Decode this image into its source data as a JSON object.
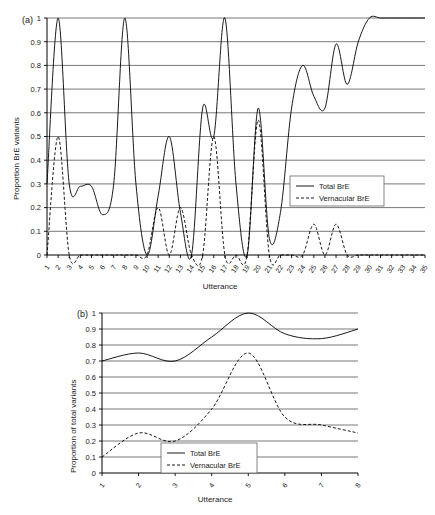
{
  "figure": {
    "header_faint_text": "",
    "panels": [
      {
        "tag": "(a)",
        "ylabel": "Proportion BrE variants",
        "xlabel": "Utterance",
        "legend": {
          "total": "Total BrE",
          "vernacular": "Vernacular BrE"
        }
      },
      {
        "tag": "(b)",
        "ylabel": "Proportion of total variants",
        "xlabel": "Utterance",
        "legend": {
          "total": "Total BrE",
          "vernacular": "Vernacular BrE"
        }
      }
    ]
  },
  "chart_data": [
    {
      "type": "line",
      "panel": "(a)",
      "title": "",
      "xlabel": "Utterance",
      "ylabel": "Proportion BrE variants",
      "xlim": [
        1,
        35
      ],
      "ylim": [
        0,
        1
      ],
      "yticks": [
        0,
        0.1,
        0.2,
        0.3,
        0.4,
        0.5,
        0.6,
        0.7,
        0.8,
        0.9,
        1
      ],
      "ytick_labels": [
        "0",
        "0.1",
        "0.2",
        "0.3",
        "0.4",
        "0.5",
        "0.6",
        "0.7",
        "0.8",
        "0.9",
        "1"
      ],
      "grid": true,
      "legend_position": "center-right",
      "categories": [
        1,
        2,
        3,
        4,
        5,
        6,
        7,
        8,
        9,
        10,
        11,
        12,
        13,
        14,
        15,
        16,
        17,
        18,
        19,
        20,
        21,
        22,
        23,
        24,
        25,
        26,
        27,
        28,
        29,
        30,
        31,
        32,
        33,
        34,
        35
      ],
      "series": [
        {
          "name": "Total BrE",
          "style": "solid",
          "values": [
            0.3,
            1.0,
            0.3,
            0.29,
            0.29,
            0.17,
            0.3,
            1.0,
            0.3,
            0.0,
            0.25,
            0.5,
            0.18,
            0.0,
            0.62,
            0.5,
            1.0,
            0.3,
            0.0,
            0.62,
            0.07,
            0.18,
            0.62,
            0.8,
            0.67,
            0.62,
            0.89,
            0.72,
            0.9,
            1.0,
            1.0,
            1.0,
            1.0,
            1.0,
            1.0
          ]
        },
        {
          "name": "Vernacular BrE",
          "style": "dashed",
          "values": [
            0.0,
            0.5,
            0.0,
            0.0,
            0.0,
            0.0,
            0.0,
            0.0,
            0.0,
            0.0,
            0.2,
            0.0,
            0.2,
            0.0,
            0.0,
            0.5,
            0.0,
            0.0,
            0.0,
            0.57,
            0.0,
            0.0,
            0.0,
            0.0,
            0.13,
            0.0,
            0.13,
            0.0,
            0.0,
            0.0,
            0.0,
            0.0,
            0.0,
            0.0,
            0.0
          ]
        }
      ]
    },
    {
      "type": "line",
      "panel": "(b)",
      "title": "",
      "xlabel": "Utterance",
      "ylabel": "Proportion of total variants",
      "xlim": [
        1,
        8
      ],
      "ylim": [
        0,
        1
      ],
      "yticks": [
        0,
        0.1,
        0.2,
        0.3,
        0.4,
        0.5,
        0.6,
        0.7,
        0.8,
        0.9,
        1
      ],
      "ytick_labels": [
        "0",
        "0.1",
        "0.2",
        "0.3",
        "0.4",
        "0.5",
        "0.6",
        "0.7",
        "0.8",
        "0.9",
        "1"
      ],
      "grid": true,
      "legend_position": "bottom-right",
      "categories": [
        1,
        2,
        3,
        4,
        5,
        6,
        7,
        8
      ],
      "series": [
        {
          "name": "Total BrE",
          "style": "solid",
          "values": [
            0.7,
            0.75,
            0.7,
            0.85,
            1.0,
            0.87,
            0.84,
            0.9
          ]
        },
        {
          "name": "Vernacular BrE",
          "style": "dashed",
          "values": [
            0.1,
            0.25,
            0.2,
            0.4,
            0.75,
            0.35,
            0.3,
            0.25
          ]
        }
      ]
    }
  ]
}
